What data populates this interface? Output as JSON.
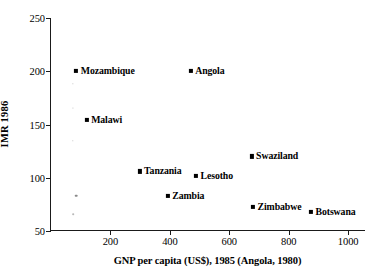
{
  "chart_data": {
    "type": "scatter",
    "title": "",
    "xlabel": "GNP per capita (US$), 1985 (Angola, 1980)",
    "ylabel": "IMR 1986",
    "xlim": [
      0,
      1060
    ],
    "ylim": [
      50,
      250
    ],
    "xticks": [
      200,
      400,
      600,
      800,
      1000
    ],
    "yticks": [
      50,
      100,
      150,
      200,
      250
    ],
    "xtick_labels": [
      "200",
      "400",
      "600",
      "800",
      "1000"
    ],
    "ytick_labels": [
      "50",
      "100",
      "150",
      "200",
      "250"
    ],
    "grid": false,
    "legend": "none",
    "marker": "square",
    "marker_color": "#000000",
    "points": [
      {
        "label": "Mozambique",
        "x": 85,
        "y": 200,
        "label_side": "right"
      },
      {
        "label": "Angola",
        "x": 470,
        "y": 200,
        "label_side": "right"
      },
      {
        "label": "Malawi",
        "x": 120,
        "y": 154,
        "label_side": "right"
      },
      {
        "label": "Swaziland",
        "x": 675,
        "y": 120,
        "label_side": "right"
      },
      {
        "label": "Tanzania",
        "x": 298,
        "y": 106,
        "label_side": "right"
      },
      {
        "label": "Lesotho",
        "x": 488,
        "y": 102,
        "label_side": "right"
      },
      {
        "label": "Zambia",
        "x": 393,
        "y": 83,
        "label_side": "right"
      },
      {
        "label": "Zimbabwe",
        "x": 680,
        "y": 73,
        "label_side": "right"
      },
      {
        "label": "Botswana",
        "x": 875,
        "y": 68,
        "label_side": "right"
      }
    ]
  }
}
